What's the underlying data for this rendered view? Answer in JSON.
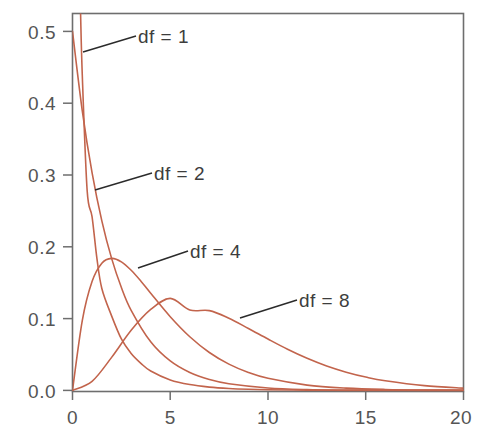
{
  "chart_data": {
    "type": "line",
    "title": "",
    "subtitle": "",
    "xlabel": "",
    "ylabel": "",
    "xlim": [
      0,
      20
    ],
    "ylim": [
      0.0,
      0.5
    ],
    "grid": false,
    "legend_position": "inline-annotations",
    "background_color": "#ffffff",
    "curve_color": "#c2644c",
    "axis_color": "#6e6e6e",
    "annotation_color": "#3d3d3d",
    "x_ticks": [
      {
        "value": 0,
        "label": "0"
      },
      {
        "value": 5,
        "label": "5"
      },
      {
        "value": 10,
        "label": "10"
      },
      {
        "value": 15,
        "label": "15"
      },
      {
        "value": 20,
        "label": "20"
      }
    ],
    "y_ticks": [
      {
        "value": 0.0,
        "label": "0.0"
      },
      {
        "value": 0.1,
        "label": "0.1"
      },
      {
        "value": 0.2,
        "label": "0.2"
      },
      {
        "value": 0.3,
        "label": "0.3"
      },
      {
        "value": 0.4,
        "label": "0.4"
      },
      {
        "value": 0.5,
        "label": "0.5"
      }
    ],
    "series": [
      {
        "name": "df = 1",
        "label": "df = 1",
        "df": 1,
        "color": "#c2644c",
        "x": [
          0.25,
          0.4,
          0.5,
          0.75,
          1.0,
          1.25,
          1.5,
          2.0,
          2.5,
          3.0,
          3.5,
          4.0,
          5.0,
          6.0,
          7.0,
          8.0,
          9.0,
          10.0,
          12.0,
          14.0,
          16.0,
          18.0,
          20.0
        ],
        "values": [
          0.7041,
          0.5399,
          0.4394,
          0.2782,
          0.242,
          0.1835,
          0.142,
          0.1038,
          0.0716,
          0.0513,
          0.0376,
          0.027,
          0.0146,
          0.0081,
          0.0046,
          0.0026,
          0.0015,
          0.0009,
          0.0003,
          0.0001,
          0.0,
          0.0,
          0.0
        ]
      },
      {
        "name": "df = 2",
        "label": "df = 2",
        "df": 2,
        "color": "#c2644c",
        "x": [
          0.0,
          0.5,
          1.0,
          1.5,
          2.0,
          2.5,
          3.0,
          4.0,
          5.0,
          6.0,
          7.0,
          8.0,
          10.0,
          12.0,
          14.0,
          16.0,
          18.0,
          20.0
        ],
        "values": [
          0.5,
          0.3894,
          0.3033,
          0.2362,
          0.1839,
          0.1433,
          0.1116,
          0.0677,
          0.041,
          0.0249,
          0.0151,
          0.0092,
          0.0034,
          0.0012,
          0.0005,
          0.0002,
          0.0001,
          0.0
        ]
      },
      {
        "name": "df = 4",
        "label": "df = 4",
        "df": 4,
        "color": "#c2644c",
        "x": [
          0.0,
          0.5,
          1.0,
          1.5,
          2.0,
          2.5,
          3.0,
          3.5,
          4.0,
          5.0,
          6.0,
          7.0,
          8.0,
          9.0,
          10.0,
          12.0,
          14.0,
          16.0,
          18.0,
          20.0
        ],
        "values": [
          0.0,
          0.0973,
          0.1516,
          0.1772,
          0.1839,
          0.1791,
          0.1673,
          0.1521,
          0.1353,
          0.1026,
          0.0747,
          0.0528,
          0.0366,
          0.025,
          0.0168,
          0.0074,
          0.0032,
          0.0013,
          0.0005,
          0.0002
        ]
      },
      {
        "name": "df = 8",
        "label": "df = 8",
        "df": 8,
        "color": "#c2644c",
        "x": [
          0.0,
          1.0,
          2.0,
          3.0,
          4.0,
          5.0,
          6.0,
          7.0,
          8.0,
          9.0,
          10.0,
          11.0,
          12.0,
          13.0,
          14.0,
          15.0,
          16.0,
          18.0,
          20.0
        ],
        "values": [
          0.0,
          0.0126,
          0.046,
          0.0837,
          0.1127,
          0.1282,
          0.112,
          0.1111,
          0.1005,
          0.0863,
          0.0715,
          0.0573,
          0.0447,
          0.034,
          0.0254,
          0.0186,
          0.0134,
          0.0066,
          0.0031
        ]
      }
    ],
    "annotations": [
      {
        "text": "df = 1",
        "series": "df = 1"
      },
      {
        "text": "df = 2",
        "series": "df = 2"
      },
      {
        "text": "df = 4",
        "series": "df = 4"
      },
      {
        "text": "df = 8",
        "series": "df = 8"
      }
    ]
  },
  "caption": ""
}
